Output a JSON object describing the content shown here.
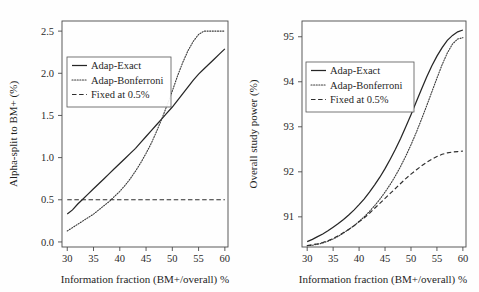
{
  "figure": {
    "background": "#fefefe",
    "line_color": "#262626"
  },
  "chart_data": [
    {
      "type": "line",
      "panel": "left",
      "title": "",
      "xlabel": "Information fraction (BM+/overall) %",
      "ylabel": "Alpha-split to BM+ (%)",
      "xlim": [
        29.0,
        60.6
      ],
      "ylim": [
        -0.06,
        2.62
      ],
      "xticks": [
        30,
        35,
        40,
        45,
        50,
        55,
        60
      ],
      "xticklabels": [
        "30",
        "35",
        "40",
        "45",
        "50",
        "55",
        "60"
      ],
      "yticks": [
        0.0,
        0.5,
        1.0,
        1.5,
        2.0,
        2.5
      ],
      "yticklabels": [
        "0.0",
        "0.5",
        "1.0",
        "1.5",
        "2.0",
        "2.5"
      ],
      "grid": false,
      "legend_position": "upper-left",
      "legend_entries": [
        "Adap-Exact",
        "Adap-Bonferroni",
        "Fixed at 0.5%"
      ],
      "x": [
        30,
        31,
        32,
        33,
        34,
        35,
        36,
        37,
        38,
        39,
        40,
        41,
        42,
        43,
        44,
        45,
        46,
        47,
        48,
        49,
        50,
        51,
        52,
        53,
        54,
        55,
        56,
        57,
        58,
        59,
        60
      ],
      "series": [
        {
          "name": "Adap-Exact",
          "style": "solid",
          "values": [
            0.33,
            0.38,
            0.45,
            0.51,
            0.57,
            0.63,
            0.69,
            0.75,
            0.81,
            0.87,
            0.93,
            0.99,
            1.05,
            1.11,
            1.18,
            1.25,
            1.32,
            1.39,
            1.46,
            1.53,
            1.6,
            1.68,
            1.76,
            1.84,
            1.92,
            1.99,
            2.05,
            2.11,
            2.17,
            2.23,
            2.29
          ]
        },
        {
          "name": "Adap-Bonferroni",
          "style": "dotted",
          "values": [
            0.13,
            0.17,
            0.21,
            0.25,
            0.29,
            0.33,
            0.38,
            0.43,
            0.48,
            0.54,
            0.6,
            0.67,
            0.75,
            0.84,
            0.94,
            1.05,
            1.17,
            1.31,
            1.46,
            1.62,
            1.79,
            1.97,
            2.13,
            2.27,
            2.38,
            2.46,
            2.5,
            2.5,
            2.5,
            2.5,
            2.5
          ]
        },
        {
          "name": "Fixed at 0.5%",
          "style": "dashdot",
          "values": [
            0.5,
            0.5,
            0.5,
            0.5,
            0.5,
            0.5,
            0.5,
            0.5,
            0.5,
            0.5,
            0.5,
            0.5,
            0.5,
            0.5,
            0.5,
            0.5,
            0.5,
            0.5,
            0.5,
            0.5,
            0.5,
            0.5,
            0.5,
            0.5,
            0.5,
            0.5,
            0.5,
            0.5,
            0.5,
            0.5,
            0.5
          ]
        }
      ]
    },
    {
      "type": "line",
      "panel": "right",
      "title": "",
      "xlabel": "Information fraction (BM+/overall) %",
      "ylabel": "Overall study power (%)",
      "xlim": [
        29.0,
        60.6
      ],
      "ylim": [
        90.33,
        95.35
      ],
      "xticks": [
        30,
        35,
        40,
        45,
        50,
        55,
        60
      ],
      "xticklabels": [
        "30",
        "35",
        "40",
        "45",
        "50",
        "55",
        "60"
      ],
      "yticks": [
        91,
        92,
        93,
        94,
        95
      ],
      "yticklabels": [
        "91",
        "92",
        "93",
        "94",
        "95"
      ],
      "grid": false,
      "legend_position": "upper-left",
      "legend_entries": [
        "Adap-Exact",
        "Adap-Bonferroni",
        "Fixed at 0.5%"
      ],
      "x": [
        30,
        31,
        32,
        33,
        34,
        35,
        36,
        37,
        38,
        39,
        40,
        41,
        42,
        43,
        44,
        45,
        46,
        47,
        48,
        49,
        50,
        51,
        52,
        53,
        54,
        55,
        56,
        57,
        58,
        59,
        60
      ],
      "series": [
        {
          "name": "Adap-Exact",
          "style": "solid",
          "values": [
            90.45,
            90.5,
            90.56,
            90.62,
            90.69,
            90.77,
            90.85,
            90.94,
            91.04,
            91.15,
            91.27,
            91.4,
            91.55,
            91.71,
            91.88,
            92.07,
            92.28,
            92.5,
            92.74,
            93.0,
            93.27,
            93.55,
            93.83,
            94.1,
            94.35,
            94.57,
            94.76,
            94.92,
            95.03,
            95.11,
            95.15
          ]
        },
        {
          "name": "Adap-Bonferroni",
          "style": "dotted",
          "values": [
            90.36,
            90.37,
            90.39,
            90.42,
            90.46,
            90.51,
            90.57,
            90.64,
            90.72,
            90.8,
            90.9,
            91.0,
            91.12,
            91.25,
            91.39,
            91.55,
            91.72,
            91.91,
            92.12,
            92.35,
            92.6,
            92.87,
            93.16,
            93.46,
            93.77,
            94.08,
            94.38,
            94.64,
            94.84,
            94.95,
            94.98
          ]
        },
        {
          "name": "Fixed at 0.5%",
          "style": "dashdot",
          "values": [
            90.36,
            90.38,
            90.4,
            90.43,
            90.47,
            90.52,
            90.58,
            90.65,
            90.72,
            90.8,
            90.89,
            90.98,
            91.08,
            91.19,
            91.3,
            91.41,
            91.52,
            91.63,
            91.74,
            91.85,
            91.95,
            92.04,
            92.13,
            92.21,
            92.28,
            92.34,
            92.39,
            92.42,
            92.44,
            92.45,
            92.46
          ]
        }
      ]
    }
  ]
}
